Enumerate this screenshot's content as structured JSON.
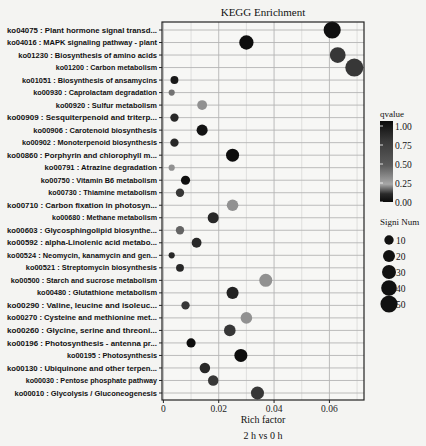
{
  "chart_data": {
    "type": "scatter",
    "title": "KEGG Enrichment",
    "xlabel": "Rich factor",
    "subtitle": "2 h vs 0 h",
    "xlim": [
      -0.0005,
      0.0725
    ],
    "x_ticks": [
      0,
      0.02,
      0.04,
      0.06
    ],
    "x_tick_labels": [
      "0",
      "0.02",
      "0.04",
      "0.06"
    ],
    "grid": true,
    "color_legend": {
      "title": "qvalue",
      "ticks": [
        "1.00",
        "0.75",
        "0.50",
        "0.25",
        "0.00"
      ]
    },
    "size_legend": {
      "title": "Signi Num",
      "values": [
        10,
        20,
        30,
        40,
        50
      ]
    },
    "points": [
      {
        "label": "ko04075 : Plant hormone signal transd...",
        "x": 0.061,
        "qvalue": 0.02,
        "size": 44
      },
      {
        "label": "ko04016 : MAPK signaling pathway - plant",
        "x": 0.03,
        "qvalue": 0.01,
        "size": 28
      },
      {
        "label": "ko01230 : Biosynthesis of amino acids",
        "x": 0.063,
        "qvalue": 0.15,
        "size": 36
      },
      {
        "label": "ko01200 : Carbon metabolism",
        "x": 0.069,
        "qvalue": 0.15,
        "size": 50
      },
      {
        "label": "ko01051 : Biosynthesis of ansamycins",
        "x": 0.004,
        "qvalue": 0.05,
        "size": 5
      },
      {
        "label": "ko00930 : Caprolactam degradation",
        "x": 0.003,
        "qvalue": 0.35,
        "size": 2
      },
      {
        "label": "ko00920 : Sulfur metabolism",
        "x": 0.014,
        "qvalue": 0.45,
        "size": 10
      },
      {
        "label": "ko00909 : Sesquiterpenoid and triterp...",
        "x": 0.004,
        "qvalue": 0.1,
        "size": 6
      },
      {
        "label": "ko00906 : Carotenoid biosynthesis",
        "x": 0.014,
        "qvalue": 0.03,
        "size": 14
      },
      {
        "label": "ko00902 : Monoterpenoid biosynthesis",
        "x": 0.004,
        "qvalue": 0.1,
        "size": 6
      },
      {
        "label": "ko00860 : Porphyrin and chlorophyll m...",
        "x": 0.025,
        "qvalue": 0.01,
        "size": 22
      },
      {
        "label": "ko00791 : Atrazine degradation",
        "x": 0.003,
        "qvalue": 0.45,
        "size": 2
      },
      {
        "label": "ko00750 : Vitamin B6 metabolism",
        "x": 0.008,
        "qvalue": 0.02,
        "size": 8
      },
      {
        "label": "ko00730 : Thiamine metabolism",
        "x": 0.006,
        "qvalue": 0.15,
        "size": 6
      },
      {
        "label": "ko00710 : Carbon fixation in photosyn...",
        "x": 0.025,
        "qvalue": 0.45,
        "size": 16
      },
      {
        "label": "ko00680 : Methane metabolism",
        "x": 0.018,
        "qvalue": 0.1,
        "size": 14
      },
      {
        "label": "ko00603 : Glycosphingolipid biosynthe...",
        "x": 0.006,
        "qvalue": 0.3,
        "size": 6
      },
      {
        "label": "ko00592 : alpha-Linolenic acid metabo...",
        "x": 0.012,
        "qvalue": 0.1,
        "size": 10
      },
      {
        "label": "ko00524 : Neomycin, kanamycin and gen...",
        "x": 0.003,
        "qvalue": 0.1,
        "size": 2
      },
      {
        "label": "ko00521 : Streptomycin biosynthesis",
        "x": 0.006,
        "qvalue": 0.1,
        "size": 5
      },
      {
        "label": "ko00500 : Starch and sucrose metabolism",
        "x": 0.037,
        "qvalue": 0.45,
        "size": 22
      },
      {
        "label": "ko00480 : Glutathione metabolism",
        "x": 0.025,
        "qvalue": 0.08,
        "size": 18
      },
      {
        "label": "ko00290 : Valine, leucine and isoleuc...",
        "x": 0.008,
        "qvalue": 0.15,
        "size": 6
      },
      {
        "label": "ko00270 : Cysteine and methionine met...",
        "x": 0.03,
        "qvalue": 0.45,
        "size": 16
      },
      {
        "label": "ko00260 : Glycine, serine and threoni...",
        "x": 0.024,
        "qvalue": 0.15,
        "size": 16
      },
      {
        "label": "ko00196 : Photosynthesis - antenna pr...",
        "x": 0.01,
        "qvalue": 0.01,
        "size": 8
      },
      {
        "label": "ko00195 : Photosynthesis",
        "x": 0.028,
        "qvalue": 0.01,
        "size": 22
      },
      {
        "label": "ko00130 : Ubiquinone and other terpen...",
        "x": 0.015,
        "qvalue": 0.1,
        "size": 12
      },
      {
        "label": "ko00030 : Pentose phosphate pathway",
        "x": 0.018,
        "qvalue": 0.15,
        "size": 12
      },
      {
        "label": "ko00010 : Glycolysis / Gluconeogenesis",
        "x": 0.034,
        "qvalue": 0.15,
        "size": 22
      }
    ]
  },
  "colors": {
    "background": "#f4f4f2",
    "panel": "#f7f7f5",
    "grid": "#b4b4b4",
    "axis": "#222222",
    "text": "#111111"
  }
}
